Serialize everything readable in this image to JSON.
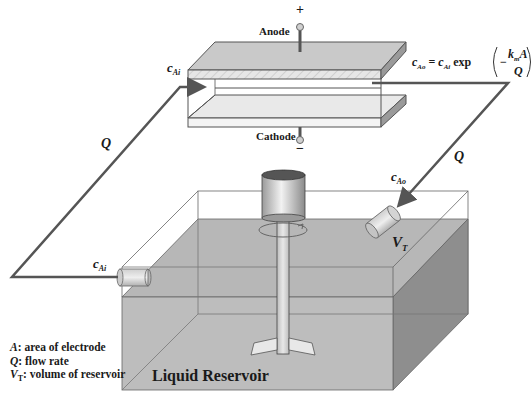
{
  "diagram": {
    "cell": {
      "anode_label": "Anode",
      "anode_sign": "+",
      "cathode_label": "Cathode",
      "cathode_sign": "−"
    },
    "labels": {
      "inlet_conc_top": "c",
      "inlet_conc_top_sub": "Ai",
      "inlet_conc_bottom": "c",
      "inlet_conc_bottom_sub": "Ai",
      "outlet_conc": "c",
      "outlet_conc_sub": "Ao",
      "flow_left": "Q",
      "flow_right": "Q",
      "volume": "V",
      "volume_sub": "T"
    },
    "equation": {
      "lhs": "c",
      "lhs_sub": "Ao",
      "eq": "=",
      "rhs_c": "c",
      "rhs_sub": "Ai",
      "func": "exp",
      "minus": "−",
      "numerator_k": "k",
      "numerator_sub": "m",
      "numerator_A": "A",
      "denominator": "Q"
    },
    "reservoir_label": "Liquid Reservoir",
    "legend": [
      {
        "symbol": "A",
        "sub": "",
        "text": ": area of electrode"
      },
      {
        "symbol": "Q",
        "sub": "",
        "text": ": flow rate"
      },
      {
        "symbol": "V",
        "sub": "T",
        "text": ": volume of reservoir"
      }
    ],
    "colors": {
      "line": "#555555",
      "liquid": "#b9b9b9",
      "liquid_side": "#8e8e8e",
      "plate": "#c8c8c8",
      "plate_edge": "#9a9a9a"
    }
  }
}
